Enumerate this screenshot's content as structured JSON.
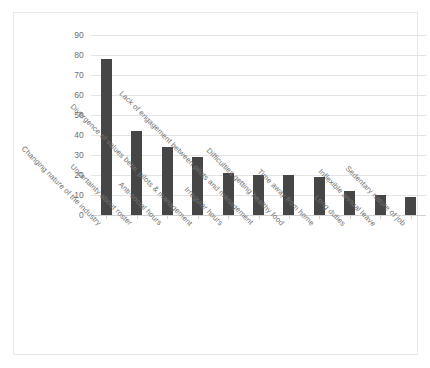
{
  "chart_data": {
    "type": "bar",
    "title": "",
    "subtitle": "",
    "xlabel": "",
    "ylabel": "",
    "ylim": [
      0,
      90
    ],
    "ytick_step": 10,
    "yticks": [
      0,
      10,
      20,
      30,
      40,
      50,
      60,
      70,
      80,
      90
    ],
    "grid": true,
    "legend": false,
    "bar_color": "#464646",
    "gridline_color": "#e4e4e4",
    "frame_color": "#e8e8e8",
    "categories": [
      "Changing nature of the industry",
      "Uncertainty about roster",
      "Anti-social hours",
      "Divergence of values betw. pilots & management",
      "Irregular hours",
      "Lack of engagement between pilots and management",
      "Difficulties getting healthy food",
      "Time away from home",
      "Long duties",
      "Inflexible annual leave",
      "Sedentary nature of job"
    ],
    "values": [
      78,
      42,
      34,
      29,
      21,
      20,
      20,
      19,
      12,
      10,
      9
    ]
  }
}
